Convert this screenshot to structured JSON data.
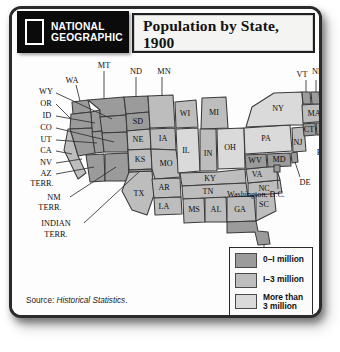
{
  "header": {
    "logo": {
      "line1": "NATIONAL",
      "line2": "GEOGRAPHIC"
    },
    "title_line1": "Population by State,",
    "title_line2": "1900"
  },
  "source": {
    "prefix": "Source: ",
    "title": "Historical Statistics",
    "suffix": "."
  },
  "legend": {
    "items": [
      {
        "label": "0–I million",
        "color": "#9b9b9b"
      },
      {
        "label": "I–3 million",
        "color": "#bdbdbd"
      },
      {
        "label": "More than\n3 million",
        "color": "#dadada"
      }
    ]
  },
  "chart_data": {
    "type": "map",
    "title": "Population by State, 1900",
    "source": "Historical Statistics",
    "legend_position": "bottom-right",
    "bins": [
      {
        "label": "0–1 million",
        "color": "#9b9b9b"
      },
      {
        "label": "1–3 million",
        "color": "#bdbdbd"
      },
      {
        "label": "More than 3 million",
        "color": "#dadada"
      }
    ],
    "regions": [
      {
        "code": "WA",
        "bin": 0,
        "label_placement": "callout-left"
      },
      {
        "code": "OR",
        "bin": 0,
        "label_placement": "callout-left"
      },
      {
        "code": "ID",
        "bin": 0,
        "label_placement": "callout-left"
      },
      {
        "code": "MT",
        "bin": 0,
        "label_placement": "callout-top"
      },
      {
        "code": "WY",
        "bin": 0,
        "label_placement": "callout-left"
      },
      {
        "code": "CO",
        "bin": 0,
        "label_placement": "callout-left"
      },
      {
        "code": "UT",
        "bin": 0,
        "label_placement": "callout-left"
      },
      {
        "code": "NV",
        "bin": 0,
        "label_placement": "callout-left"
      },
      {
        "code": "CA",
        "bin": 1,
        "label_placement": "callout-left"
      },
      {
        "code": "AZ TERR.",
        "bin": 0,
        "label_placement": "callout-left"
      },
      {
        "code": "NM TERR.",
        "bin": 0,
        "label_placement": "callout-left"
      },
      {
        "code": "INDIAN TERR.",
        "bin": 0,
        "label_placement": "callout-left"
      },
      {
        "code": "ND",
        "bin": 0,
        "label_placement": "callout-top"
      },
      {
        "code": "SD",
        "bin": 0,
        "label_placement": "inside"
      },
      {
        "code": "NE",
        "bin": 1,
        "label_placement": "inside"
      },
      {
        "code": "KS",
        "bin": 1,
        "label_placement": "inside"
      },
      {
        "code": "TX",
        "bin": 1,
        "label_placement": "inside"
      },
      {
        "code": "MN",
        "bin": 1,
        "label_placement": "callout-top"
      },
      {
        "code": "IA",
        "bin": 1,
        "label_placement": "inside"
      },
      {
        "code": "MO",
        "bin": 1,
        "label_placement": "inside"
      },
      {
        "code": "AR",
        "bin": 1,
        "label_placement": "inside"
      },
      {
        "code": "LA",
        "bin": 1,
        "label_placement": "inside"
      },
      {
        "code": "WI",
        "bin": 1,
        "label_placement": "inside"
      },
      {
        "code": "IL",
        "bin": 2,
        "label_placement": "inside"
      },
      {
        "code": "MI",
        "bin": 1,
        "label_placement": "inside"
      },
      {
        "code": "IN",
        "bin": 1,
        "label_placement": "inside"
      },
      {
        "code": "OH",
        "bin": 2,
        "label_placement": "inside"
      },
      {
        "code": "KY",
        "bin": 1,
        "label_placement": "inside"
      },
      {
        "code": "TN",
        "bin": 1,
        "label_placement": "inside"
      },
      {
        "code": "MS",
        "bin": 1,
        "label_placement": "inside"
      },
      {
        "code": "AL",
        "bin": 1,
        "label_placement": "inside"
      },
      {
        "code": "GA",
        "bin": 1,
        "label_placement": "inside"
      },
      {
        "code": "SC",
        "bin": 1,
        "label_placement": "inside"
      },
      {
        "code": "FL",
        "bin": 0,
        "label_placement": "callout-bottom"
      },
      {
        "code": "NC",
        "bin": 1,
        "label_placement": "inside"
      },
      {
        "code": "VA",
        "bin": 1,
        "label_placement": "inside"
      },
      {
        "code": "WV",
        "bin": 0,
        "label_placement": "inside"
      },
      {
        "code": "MD",
        "bin": 0,
        "label_placement": "inside"
      },
      {
        "code": "DE",
        "bin": 0,
        "label_placement": "callout-right"
      },
      {
        "code": "Washington, D.C.",
        "bin": 0,
        "label_placement": "callout-right"
      },
      {
        "code": "PA",
        "bin": 2,
        "label_placement": "inside"
      },
      {
        "code": "NJ",
        "bin": 1,
        "label_placement": "inside"
      },
      {
        "code": "NY",
        "bin": 2,
        "label_placement": "inside"
      },
      {
        "code": "CT",
        "bin": 0,
        "label_placement": "inside"
      },
      {
        "code": "RI",
        "bin": 0,
        "label_placement": "callout-bottom"
      },
      {
        "code": "MA",
        "bin": 1,
        "label_placement": "inside"
      },
      {
        "code": "VT",
        "bin": 0,
        "label_placement": "callout-top"
      },
      {
        "code": "NH",
        "bin": 0,
        "label_placement": "callout-top"
      },
      {
        "code": "ME",
        "bin": 0,
        "label_placement": "inside"
      }
    ]
  },
  "map": {
    "labels": {
      "MT": "MT",
      "ND": "ND",
      "MN": "MN",
      "WA": "WA",
      "WY": "WY",
      "OR": "OR",
      "ID": "ID",
      "CO": "CO",
      "UT": "UT",
      "CA": "CA",
      "NV": "NV",
      "AZ1": "AZ",
      "AZ2": "TERR.",
      "NM1": "NM",
      "NM2": "TERR.",
      "IND1": "INDIAN",
      "IND2": "TERR.",
      "SD": "SD",
      "NE": "NE",
      "KS": "KS",
      "IA": "IA",
      "MO": "MO",
      "TX": "TX",
      "AR": "AR",
      "LA": "LA",
      "MS": "MS",
      "AL": "AL",
      "GA": "GA",
      "SC": "SC",
      "FL": "FL",
      "TN": "TN",
      "NC": "NC",
      "KY": "KY",
      "VA": "VA",
      "WV": "WV",
      "MD": "MD",
      "DE": "DE",
      "DC": "Washington, D.C.",
      "WI": "WI",
      "IL": "IL",
      "MI": "MI",
      "IN": "IN",
      "OH": "OH",
      "PA": "PA",
      "NY": "NY",
      "NJ": "NJ",
      "CT": "CT",
      "RI": "RI",
      "MA": "MA",
      "VT": "VT",
      "NH": "NH",
      "ME": "ME"
    }
  }
}
